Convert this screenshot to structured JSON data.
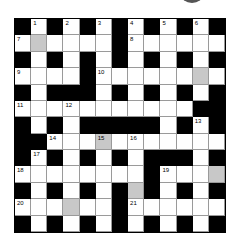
{
  "puzzle": {
    "rows": 13,
    "cols": 13,
    "colors": {
      "block": "#000000",
      "shaded": "#c8c8c8",
      "open": "#ffffff"
    },
    "grid": [
      [
        "B",
        "1",
        "B",
        "2",
        "B",
        "3",
        "B",
        "4",
        "B",
        "5",
        "B",
        "6",
        "B"
      ],
      [
        "7",
        "G",
        "W",
        "W",
        "W",
        "W",
        "B",
        "8",
        "W",
        "W",
        "W",
        "W",
        "W"
      ],
      [
        "B",
        "W",
        "B",
        "W",
        "B",
        "W",
        "B",
        "W",
        "B",
        "W",
        "B",
        "W",
        "B"
      ],
      [
        "9",
        "W",
        "W",
        "W",
        "B",
        "10",
        "W",
        "W",
        "W",
        "W",
        "W",
        "G",
        "W"
      ],
      [
        "B",
        "W",
        "B",
        "B",
        "B",
        "W",
        "B",
        "W",
        "B",
        "W",
        "B",
        "W",
        "B"
      ],
      [
        "11",
        "W",
        "W",
        "12",
        "W",
        "W",
        "W",
        "W",
        "W",
        "W",
        "W",
        "B",
        "B"
      ],
      [
        "B",
        "W",
        "B",
        "W",
        "B",
        "B",
        "B",
        "B",
        "B",
        "W",
        "B",
        "13",
        "B"
      ],
      [
        "B",
        "B",
        "14",
        "W",
        "W",
        "15G",
        "W",
        "16",
        "W",
        "W",
        "W",
        "W",
        "W"
      ],
      [
        "B",
        "17",
        "B",
        "W",
        "B",
        "W",
        "B",
        "W",
        "B",
        "B",
        "B",
        "W",
        "B"
      ],
      [
        "18",
        "W",
        "W",
        "W",
        "W",
        "W",
        "W",
        "W",
        "B",
        "19",
        "W",
        "W",
        "G"
      ],
      [
        "B",
        "W",
        "B",
        "W",
        "B",
        "W",
        "B",
        "G",
        "B",
        "W",
        "B",
        "W",
        "B"
      ],
      [
        "20",
        "W",
        "W",
        "G",
        "W",
        "W",
        "B",
        "21",
        "W",
        "W",
        "W",
        "W",
        "W"
      ],
      [
        "B",
        "W",
        "B",
        "W",
        "B",
        "W",
        "B",
        "W",
        "B",
        "W",
        "B",
        "W",
        "B"
      ]
    ],
    "clue_numbers": [
      "1",
      "2",
      "3",
      "4",
      "5",
      "6",
      "7",
      "8",
      "9",
      "10",
      "11",
      "12",
      "13",
      "14",
      "15",
      "16",
      "17",
      "18",
      "19",
      "20",
      "21"
    ]
  }
}
